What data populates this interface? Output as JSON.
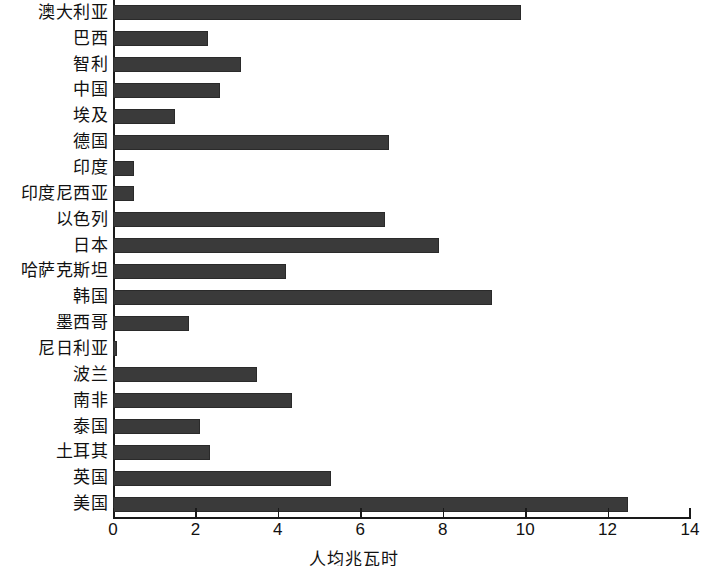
{
  "chart_data": {
    "type": "bar",
    "orientation": "horizontal",
    "title": "",
    "xlabel": "人均兆瓦时",
    "ylabel": "",
    "xlim": [
      0,
      14
    ],
    "xticks": [
      0,
      2,
      4,
      6,
      8,
      10,
      12,
      14
    ],
    "xtick_labels": [
      "0",
      "2",
      "4",
      "6",
      "8",
      "10",
      "12",
      "14"
    ],
    "grid": false,
    "legend": null,
    "bar_color": "#3a3a3a",
    "categories": [
      "澳大利亚",
      "巴西",
      "智利",
      "中国",
      "埃及",
      "德国",
      "印度",
      "印度尼西亚",
      "以色列",
      "日本",
      "哈萨克斯坦",
      "韩国",
      "墨西哥",
      "尼日利亚",
      "波兰",
      "南非",
      "泰国",
      "土耳其",
      "英国",
      "美国"
    ],
    "values": [
      9.9,
      2.3,
      3.1,
      2.6,
      1.5,
      6.7,
      0.5,
      0.5,
      6.6,
      7.9,
      4.2,
      9.2,
      1.85,
      0.1,
      3.5,
      4.35,
      2.1,
      2.35,
      5.3,
      12.5
    ]
  }
}
